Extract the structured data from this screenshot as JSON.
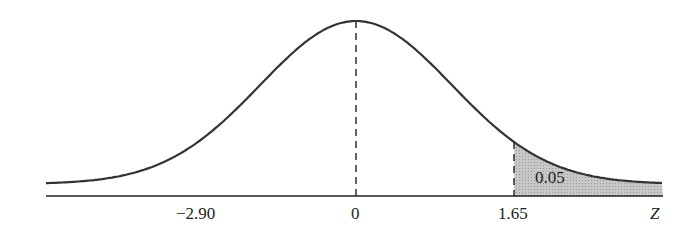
{
  "chart_data": {
    "type": "area",
    "title": "",
    "xlabel": "Z",
    "tick_labels": [
      "-2.90",
      "0",
      "1.65"
    ],
    "tick_values": [
      -2.9,
      0,
      1.65
    ],
    "reference_lines": [
      {
        "x": 0,
        "style": "dashed"
      },
      {
        "x": 1.65,
        "style": "dashed"
      }
    ],
    "shaded_region": {
      "from": 1.65,
      "to": "inf",
      "area": 0.05,
      "label": "0.05"
    },
    "grid": false,
    "legend": null
  },
  "labels": {
    "tick_neg": "−2.90",
    "tick_zero": "0",
    "tick_crit": "1.65",
    "axis": "Z",
    "area": "0.05"
  },
  "colors": {
    "curve": "#333333",
    "shade": "#bdbdbd",
    "axis": "#222222"
  }
}
